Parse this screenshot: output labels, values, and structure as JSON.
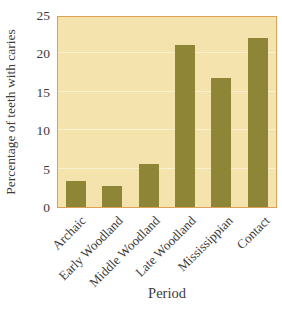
{
  "chart_data": {
    "type": "bar",
    "title": "",
    "categories": [
      "Archaic",
      "Early Woodland",
      "Middle Woodland",
      "Late Woodland",
      "Mississippian",
      "Contact"
    ],
    "values": [
      3.4,
      2.7,
      5.7,
      21.3,
      17.0,
      22.2
    ],
    "xlabel": "Period",
    "ylabel": "Percentage of teeth with caries",
    "ylim": [
      0,
      25
    ],
    "yticks": [
      0,
      5,
      10,
      15,
      20,
      25
    ],
    "grid": "horizontal, faint, at 5-unit intervals",
    "legend": "none",
    "colors": {
      "bar": "#8e8636",
      "plot_background": "#f4e3ad",
      "plot_border": "#dca157",
      "gridline": "#faf0cf",
      "text": "#3b3b3b",
      "page_background": "#ffffff"
    }
  }
}
